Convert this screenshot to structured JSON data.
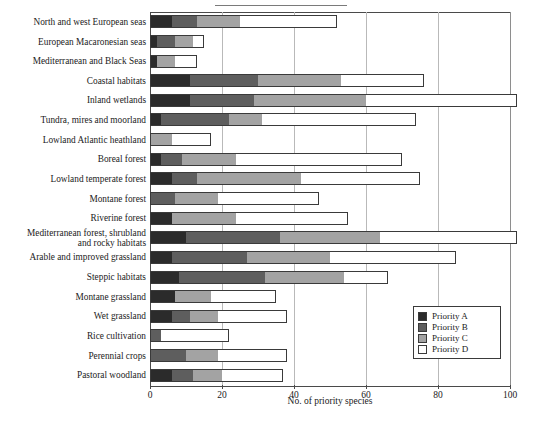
{
  "figure": {
    "xlabel": "No. of priority species",
    "colors": {
      "priority_a": "#2b2b2b",
      "priority_b": "#5e5e5e",
      "priority_c": "#a3a3a3",
      "priority_d": "#ffffff",
      "axis": "#4a4a4a",
      "grid": "#b9b9b9"
    }
  },
  "legend": {
    "items": [
      {
        "label": "Priority A",
        "key": "a"
      },
      {
        "label": "Priority B",
        "key": "b"
      },
      {
        "label": "Priority C",
        "key": "c"
      },
      {
        "label": "Priority D",
        "key": "d"
      }
    ]
  },
  "chart_data": {
    "type": "bar",
    "orientation": "horizontal",
    "stacked": true,
    "title": "",
    "subtitle": "",
    "xlabel": "No. of priority species",
    "ylabel": "",
    "xlim": [
      0,
      100
    ],
    "xticks": [
      0,
      20,
      40,
      60,
      80,
      100
    ],
    "xtick_labels": [
      "0",
      "20",
      "40",
      "60",
      "80",
      "100"
    ],
    "grid": "vertical",
    "legend_position": "inside-right-lower",
    "series": [
      {
        "name": "Priority A",
        "color": "#2b2b2b",
        "values": [
          6,
          2,
          2,
          11,
          11,
          3,
          0,
          3,
          6,
          0,
          6,
          10,
          6,
          8,
          7,
          6,
          0,
          0,
          6
        ]
      },
      {
        "name": "Priority B",
        "color": "#5e5e5e",
        "values": [
          7,
          5,
          0,
          19,
          18,
          19,
          0,
          6,
          7,
          7,
          0,
          26,
          21,
          24,
          0,
          5,
          3,
          10,
          6
        ]
      },
      {
        "name": "Priority C",
        "color": "#a3a3a3",
        "values": [
          12,
          5,
          5,
          23,
          31,
          9,
          6,
          15,
          29,
          12,
          18,
          28,
          23,
          22,
          10,
          8,
          0,
          9,
          8
        ]
      },
      {
        "name": "Priority D",
        "color": "#ffffff",
        "values": [
          27,
          3,
          6,
          23,
          42,
          43,
          11,
          46,
          33,
          28,
          31,
          38,
          35,
          12,
          18,
          19,
          19,
          19,
          17
        ]
      }
    ],
    "categories": [
      "North and west European seas",
      "European Macaronesian seas",
      "Mediterranean and Black Seas",
      "Coastal habitats",
      "Inland wetlands",
      "Tundra, mires and moorland",
      "Lowland Atlantic heathland",
      "Boreal forest",
      "Lowland temperate forest",
      "Montane forest",
      "Riverine forest",
      "Mediterranean forest, shrubland\nand rocky habitats",
      "Arable and improved grassland",
      "Steppic habitats",
      "Montane grassland",
      "Wet grassland",
      "Rice cultivation",
      "Perennial crops",
      "Pastoral woodland"
    ],
    "totals": [
      52,
      15,
      13,
      76,
      102,
      74,
      17,
      70,
      75,
      47,
      55,
      102,
      85,
      66,
      35,
      38,
      22,
      38,
      37
    ]
  }
}
